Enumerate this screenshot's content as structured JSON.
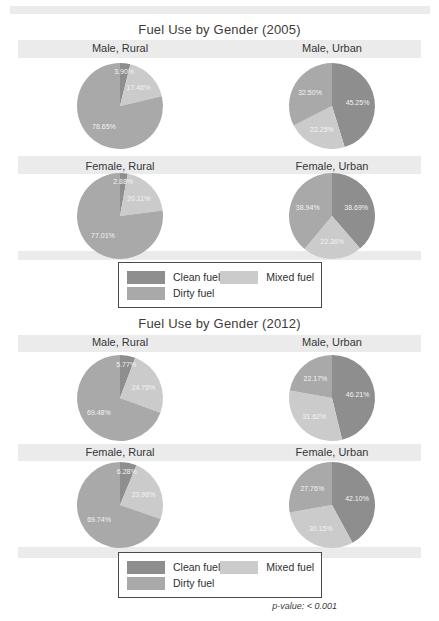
{
  "footnote": "p-value: < 0.001",
  "chart_data": [
    {
      "type": "pie",
      "title": "Fuel Use by Gender (2005)",
      "legend_position": "bottom",
      "colors": {
        "clean": "#8e8e8e",
        "dirty": "#a9a9a9",
        "mixed": "#cbcbcb",
        "label_text": "#f3f3f3"
      },
      "legend": [
        {
          "key": "clean",
          "label": "Clean fuel"
        },
        {
          "key": "dirty",
          "label": "Dirty fuel"
        },
        {
          "key": "mixed",
          "label": "Mixed fuel"
        }
      ],
      "pies": [
        {
          "title": "Male, Rural",
          "slices": [
            {
              "key": "clean",
              "value": 3.9,
              "label": "3.90%"
            },
            {
              "key": "mixed",
              "value": 17.46,
              "label": "17.46%"
            },
            {
              "key": "dirty",
              "value": 78.65,
              "label": "78.65%"
            }
          ]
        },
        {
          "title": "Male, Urban",
          "slices": [
            {
              "key": "clean",
              "value": 45.25,
              "label": "45.25%"
            },
            {
              "key": "mixed",
              "value": 22.25,
              "label": "22.25%"
            },
            {
              "key": "dirty",
              "value": 32.5,
              "label": "32.50%"
            }
          ]
        },
        {
          "title": "Female, Rural",
          "slices": [
            {
              "key": "clean",
              "value": 2.88,
              "label": "2.88%"
            },
            {
              "key": "mixed",
              "value": 20.11,
              "label": "20.11%"
            },
            {
              "key": "dirty",
              "value": 77.01,
              "label": "77.01%"
            }
          ]
        },
        {
          "title": "Female, Urban",
          "slices": [
            {
              "key": "clean",
              "value": 38.69,
              "label": "38.69%"
            },
            {
              "key": "mixed",
              "value": 22.36,
              "label": "22.36%"
            },
            {
              "key": "dirty",
              "value": 38.94,
              "label": "38.94%"
            }
          ]
        }
      ]
    },
    {
      "type": "pie",
      "title": "Fuel Use by Gender (2012)",
      "legend_position": "bottom",
      "colors": {
        "clean": "#8e8e8e",
        "dirty": "#a9a9a9",
        "mixed": "#cbcbcb",
        "label_text": "#f3f3f3"
      },
      "legend": [
        {
          "key": "clean",
          "label": "Clean fuel"
        },
        {
          "key": "dirty",
          "label": "Dirty fuel"
        },
        {
          "key": "mixed",
          "label": "Mixed fuel"
        }
      ],
      "pies": [
        {
          "title": "Male, Rural",
          "slices": [
            {
              "key": "clean",
              "value": 5.77,
              "label": "5.77%"
            },
            {
              "key": "mixed",
              "value": 24.76,
              "label": "24.76%"
            },
            {
              "key": "dirty",
              "value": 69.48,
              "label": "69.48%"
            }
          ]
        },
        {
          "title": "Male, Urban",
          "slices": [
            {
              "key": "clean",
              "value": 46.21,
              "label": "46.21%"
            },
            {
              "key": "mixed",
              "value": 31.62,
              "label": "31.62%"
            },
            {
              "key": "dirty",
              "value": 22.17,
              "label": "22.17%"
            }
          ]
        },
        {
          "title": "Female, Rural",
          "slices": [
            {
              "key": "clean",
              "value": 6.28,
              "label": "6.28%"
            },
            {
              "key": "mixed",
              "value": 23.98,
              "label": "23.98%"
            },
            {
              "key": "dirty",
              "value": 69.74,
              "label": "69.74%"
            }
          ]
        },
        {
          "title": "Female, Urban",
          "slices": [
            {
              "key": "clean",
              "value": 42.1,
              "label": "42.10%"
            },
            {
              "key": "mixed",
              "value": 30.15,
              "label": "30.15%"
            },
            {
              "key": "dirty",
              "value": 27.76,
              "label": "27.76%"
            }
          ]
        }
      ]
    }
  ]
}
